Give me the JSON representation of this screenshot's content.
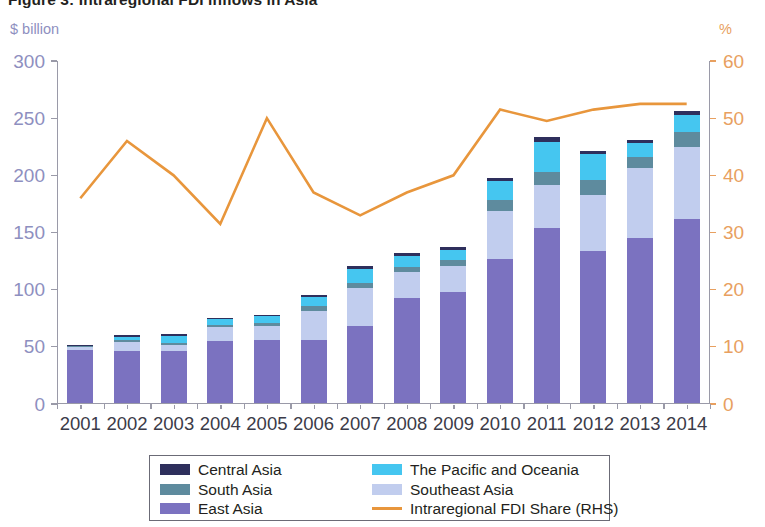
{
  "figure": {
    "title": "Figure 3: Intraregional FDI inflows in Asia",
    "left_unit": "$ billion",
    "right_unit": "%"
  },
  "legend": {
    "column1": [
      {
        "label": "Central Asia",
        "color": "#2e2f5c",
        "type": "swatch"
      },
      {
        "label": "South Asia",
        "color": "#5e8b9e",
        "type": "swatch"
      },
      {
        "label": "East Asia",
        "color": "#7b72c0",
        "type": "swatch"
      }
    ],
    "column2": [
      {
        "label": "The Pacific and Oceania",
        "color": "#45c6f0",
        "type": "swatch"
      },
      {
        "label": "Southeast Asia",
        "color": "#c1cdee",
        "type": "swatch"
      },
      {
        "label": "Intraregional FDI Share (RHS)",
        "color": "#e8963c",
        "type": "line"
      }
    ]
  },
  "chart_data": {
    "type": "bar",
    "title": "Figure 3: Intraregional FDI inflows in Asia",
    "xlabel": "",
    "ylabel": "$ billion",
    "ylabel_right": "%",
    "ylim": [
      0,
      300
    ],
    "ylim_right": [
      0,
      60
    ],
    "yticks": [
      0,
      50,
      100,
      150,
      200,
      250,
      300
    ],
    "yticks_right": [
      0,
      10,
      20,
      30,
      40,
      50,
      60
    ],
    "grid": false,
    "legend_position": "bottom",
    "stacked": true,
    "categories": [
      "2001",
      "2002",
      "2003",
      "2004",
      "2005",
      "2006",
      "2007",
      "2008",
      "2009",
      "2010",
      "2011",
      "2012",
      "2013",
      "2014"
    ],
    "series": [
      {
        "name": "East Asia",
        "color": "#7b72c0",
        "values": [
          46,
          45,
          45.5,
          54,
          55,
          55,
          67,
          92,
          97,
          126,
          153,
          133,
          144,
          161
        ]
      },
      {
        "name": "Southeast Asia",
        "color": "#c1cdee",
        "values": [
          2.5,
          8,
          5,
          12,
          12,
          25,
          33,
          22,
          23,
          42,
          37,
          49,
          61,
          63
        ]
      },
      {
        "name": "South Asia",
        "color": "#5e8b9e",
        "values": [
          0.8,
          1.5,
          2,
          2,
          2.5,
          4.5,
          5,
          4.5,
          5,
          9,
          12,
          12.5,
          10,
          13
        ]
      },
      {
        "name": "The Pacific and Oceania",
        "color": "#45c6f0",
        "values": [
          0.5,
          3,
          5.5,
          5,
          6,
          8,
          12,
          10,
          9,
          17,
          26,
          23,
          12,
          15
        ]
      },
      {
        "name": "Central Asia",
        "color": "#2e2f5c",
        "values": [
          0.7,
          1.5,
          2,
          1.5,
          1.5,
          2,
          2.5,
          2.5,
          2.5,
          3,
          4,
          2.5,
          3,
          3
        ]
      }
    ],
    "line_series": {
      "name": "Intraregional FDI Share (RHS)",
      "color": "#e8963c",
      "axis": "right",
      "values": [
        36,
        46,
        40,
        31.5,
        50,
        37,
        33,
        37,
        40,
        51.5,
        49.5,
        51.5,
        52.5,
        52.5
      ]
    }
  }
}
